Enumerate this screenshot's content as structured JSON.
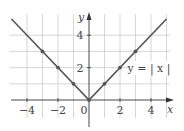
{
  "chart_data": {
    "type": "line",
    "title": "",
    "function_label": "y = | x |",
    "xlabel": "x",
    "ylabel": "y",
    "xlim": [
      -5,
      5
    ],
    "ylim": [
      -1.6,
      5
    ],
    "grid": true,
    "x_ticks": [
      -4,
      -2,
      0,
      2,
      4
    ],
    "x_tick_labels": [
      "−4",
      "−2",
      "0",
      "2",
      "4"
    ],
    "y_ticks": [
      2,
      4
    ],
    "y_tick_labels": [
      "2",
      "4"
    ],
    "series": [
      {
        "name": "y = |x|",
        "x": [
          -5,
          0,
          5
        ],
        "y": [
          5,
          0,
          5
        ],
        "color": "#555555"
      }
    ],
    "marked_points": [
      {
        "x": -3,
        "y": 3
      },
      {
        "x": -2,
        "y": 2
      },
      {
        "x": -1,
        "y": 1
      },
      {
        "x": 0,
        "y": 0
      },
      {
        "x": 1,
        "y": 1
      },
      {
        "x": 2,
        "y": 2
      },
      {
        "x": 3,
        "y": 3
      }
    ]
  },
  "style": {
    "line_color": "#555555",
    "grid_color": "#cccccc",
    "axis_color": "#333333"
  },
  "layout": {
    "origin_px": [
      89,
      100
    ],
    "unit_x_px": 15.5,
    "unit_y_px": 16.2,
    "grid_x": [
      -4,
      -3,
      -2,
      -1,
      1,
      2,
      3,
      4,
      5
    ],
    "grid_y": [
      1,
      2,
      3,
      4
    ],
    "grid_top_y": 5.3,
    "grid_bottom_y": -1.1,
    "grid_left_x": -5.1,
    "grid_right_x": 5.2
  }
}
